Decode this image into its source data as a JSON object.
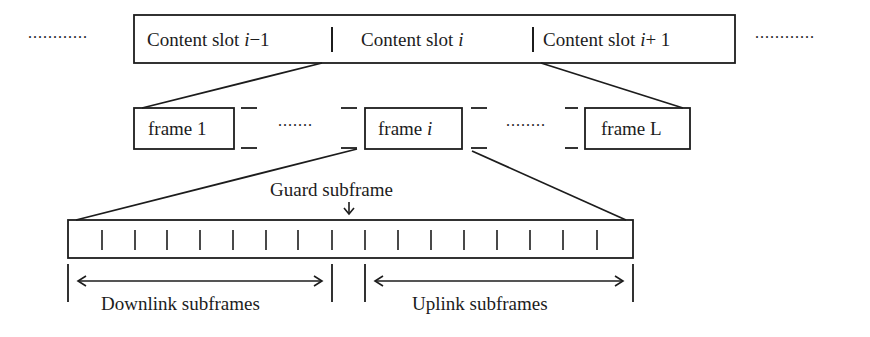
{
  "diagram": {
    "stroke_color": "#1c1c1c",
    "background": "#ffffff",
    "content_slots": {
      "left_ellipsis": "............",
      "right_ellipsis": "............",
      "slots": [
        {
          "prefix": "Content slot ",
          "var": "i",
          "suffix": "−1"
        },
        {
          "prefix": "Content slot ",
          "var": "i",
          "suffix": ""
        },
        {
          "prefix": "Content slot ",
          "var": "i",
          "suffix": "+ 1"
        }
      ]
    },
    "frames": {
      "items": [
        {
          "prefix": "frame ",
          "var": "",
          "suffix": "1"
        },
        {
          "prefix": "frame ",
          "var": "i",
          "suffix": ""
        },
        {
          "prefix": "frame ",
          "var": "",
          "suffix": "L"
        }
      ],
      "ellipsis_left": ".......",
      "ellipsis_right": "........"
    },
    "subframes": {
      "count": 17,
      "guard_label": "Guard subframe",
      "guard_index": 8,
      "downlink_label": "Downlink subframes",
      "uplink_label": "Uplink subframes"
    }
  }
}
